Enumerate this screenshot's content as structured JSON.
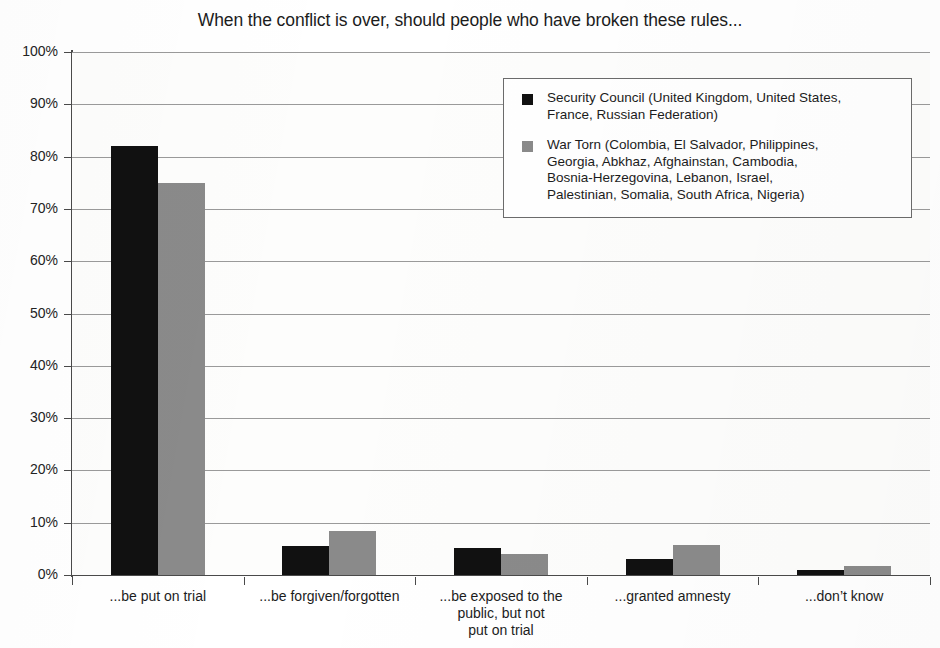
{
  "chart_data": {
    "type": "bar",
    "title": "When the conflict is over, should people who have broken these rules...",
    "xlabel": "",
    "ylabel": "",
    "ylim": [
      0,
      100
    ],
    "grid": true,
    "legend_position": "top-right",
    "categories": [
      "...be put on trial",
      "...be forgiven/forgotten",
      "...be exposed to the\npublic, but not\nput on trial",
      "...granted amnesty",
      "...don’t know"
    ],
    "ytick_labels": [
      "100%",
      "90%",
      "80%",
      "70%",
      "60%",
      "50%",
      "40%",
      "30%",
      "20%",
      "10%",
      "0%"
    ],
    "ytick_values": [
      100,
      90,
      80,
      70,
      60,
      50,
      40,
      30,
      20,
      10,
      0
    ],
    "series": [
      {
        "name": "Security Council (United Kingdom, United States, France, Russian Federation)",
        "color": "#111111",
        "values": [
          82,
          5.5,
          5.2,
          3,
          1
        ]
      },
      {
        "name": "War Torn (Colombia, El Salvador, Philippines, Georgia, Abkhaz, Afghainstan, Cambodia, Bosnia-Herzegovina, Lebanon, Israel, Palestinian, Somalia, South Africa, Nigeria)",
        "color": "#8a8a8a",
        "values": [
          75,
          8.5,
          4,
          5.7,
          1.8
        ]
      }
    ]
  },
  "legend": {
    "entries": [
      {
        "marker": "black-square",
        "label": "Security Council (United Kingdom, United States,\nFrance, Russian Federation)"
      },
      {
        "marker": "gray-square",
        "label": "War Torn (Colombia, El Salvador, Philippines,\nGeorgia, Abkhaz, Afghainstan, Cambodia,\nBosnia-Herzegovina, Lebanon, Israel,\nPalestinian, Somalia, South Africa, Nigeria)"
      }
    ]
  }
}
